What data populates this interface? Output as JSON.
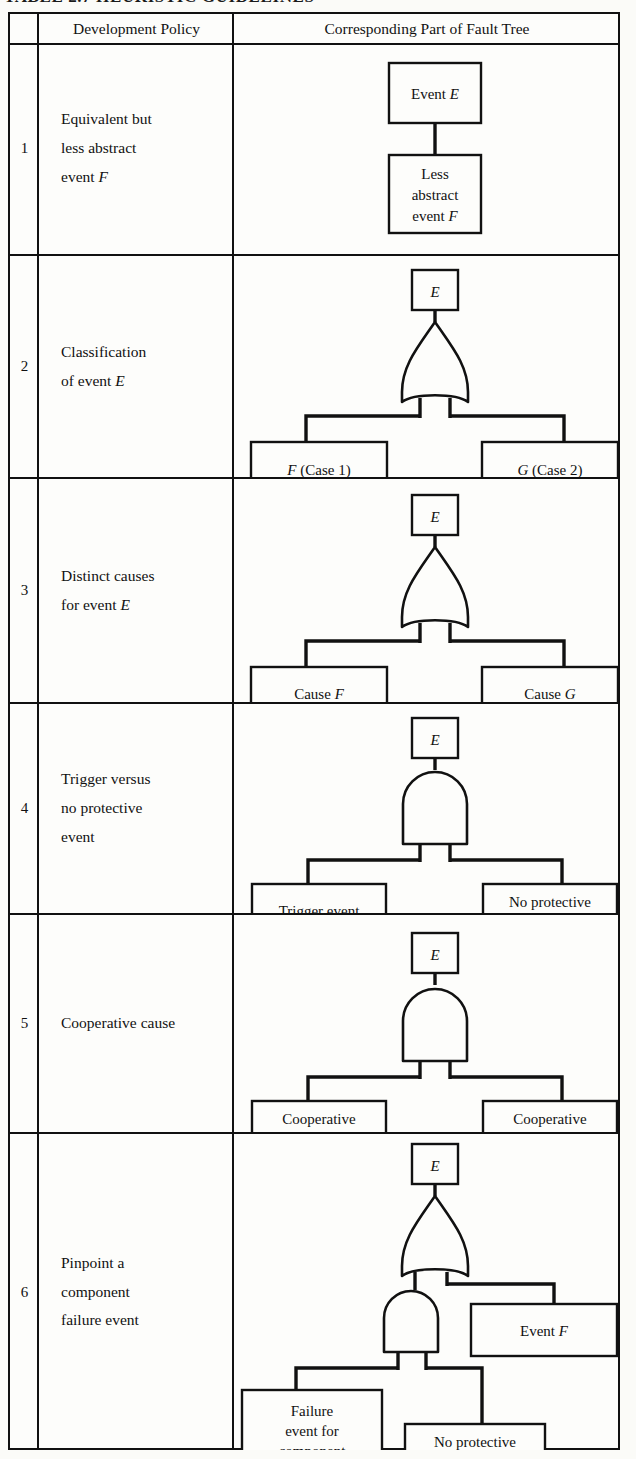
{
  "caption": {
    "text": "TABLE 2.7   HEURISTIC GUIDELINES"
  },
  "table": {
    "headers": {
      "number": "",
      "policy": "Development Policy",
      "tree": "Corresponding Part of Fault Tree"
    },
    "rows": [
      {
        "number": "1",
        "policy_lines": [
          "Equivalent but",
          "less abstract",
          "event F"
        ],
        "gate": "none",
        "nodes": {
          "top": "Event E",
          "child_lines": [
            "Less",
            "abstract",
            "event F"
          ]
        }
      },
      {
        "number": "2",
        "policy_lines": [
          "Classification",
          "of event E"
        ],
        "gate": "or",
        "nodes": {
          "top": "E",
          "left_lines": [
            "F (Case 1)"
          ],
          "right_lines": [
            "G (Case 2)"
          ]
        }
      },
      {
        "number": "3",
        "policy_lines": [
          "Distinct causes",
          "for event E"
        ],
        "gate": "or",
        "nodes": {
          "top": "E",
          "left_lines": [
            "Cause F"
          ],
          "right_lines": [
            "Cause G"
          ]
        }
      },
      {
        "number": "4",
        "policy_lines": [
          "Trigger versus",
          "no protective",
          "event"
        ],
        "gate": "and",
        "nodes": {
          "top": "E",
          "left_lines": [
            "Trigger event"
          ],
          "right_lines": [
            "No protective",
            "event"
          ]
        }
      },
      {
        "number": "5",
        "policy_lines": [
          "Cooperative cause"
        ],
        "gate": "and",
        "nodes": {
          "top": "E",
          "left_lines": [
            "Cooperative",
            "cause F"
          ],
          "right_lines": [
            "Cooperative",
            "cause G"
          ]
        }
      },
      {
        "number": "6",
        "policy_lines": [
          "Pinpoint a",
          "component",
          "failure event"
        ],
        "gate": "or-over-and",
        "nodes": {
          "top": "E",
          "right_of_or": "Event F",
          "and_left_lines": [
            "Failure",
            "event for",
            "component"
          ],
          "and_right_lines": [
            "No protective",
            "event"
          ]
        }
      }
    ],
    "row_boundaries_px": [
      12,
      43,
      254,
      477,
      702,
      913,
      1132,
      1450
    ],
    "column_boundaries_px": [
      8,
      37,
      232,
      620
    ]
  },
  "style": {
    "ink": "#111111",
    "paper": "#fdfdfb"
  }
}
